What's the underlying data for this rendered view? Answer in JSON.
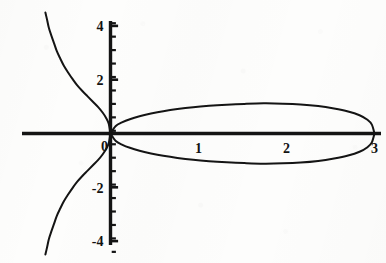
{
  "figure": {
    "background_color": "#fdfdfc",
    "ink_color": "#141414",
    "width": 386,
    "height": 263
  },
  "chart_data": {
    "type": "line",
    "title": "",
    "subtitle": "",
    "xlabel": "",
    "ylabel": "",
    "grid": false,
    "legend": "none",
    "axes": {
      "x_axis_label": "",
      "y_axis_label": "",
      "xlim": [
        -1.15,
        3.55
      ],
      "ylim": [
        -4.6,
        4.6
      ],
      "x_tick_labels": [
        "0",
        "1",
        "2",
        "3"
      ],
      "x_tick_values": [
        0,
        1,
        2,
        3
      ],
      "y_tick_labels": [
        "4",
        "2",
        "-2",
        "-4"
      ],
      "y_tick_values": [
        4,
        2,
        -2,
        -4
      ],
      "y_minor_tick_spacing": 0.5,
      "x_minor_ticks": false,
      "origin_label": "0",
      "axis_line_width_px": 3.2,
      "tick_style": "y-axis only, minor ticks every 0.5"
    },
    "curve_equation": "y^2 = x (x - 3)^2",
    "features": [
      {
        "name": "node",
        "x": 3,
        "y": 0
      },
      {
        "name": "origin-crossing",
        "x": 0,
        "y": 0
      },
      {
        "name": "loop-top-max",
        "x": 1.8,
        "y": 1.12
      },
      {
        "name": "loop-bottom-min",
        "x": 1.8,
        "y": -1.12
      }
    ],
    "series": [
      {
        "name": "loop-upper",
        "points": [
          [
            0,
            0
          ],
          [
            0.06,
            0.28
          ],
          [
            0.13,
            0.41
          ],
          [
            0.22,
            0.53
          ],
          [
            0.33,
            0.64
          ],
          [
            0.46,
            0.74
          ],
          [
            0.6,
            0.83
          ],
          [
            0.76,
            0.91
          ],
          [
            0.94,
            0.98
          ],
          [
            1.12,
            1.03
          ],
          [
            1.32,
            1.07
          ],
          [
            1.52,
            1.1
          ],
          [
            1.74,
            1.12
          ],
          [
            1.96,
            1.11
          ],
          [
            2.16,
            1.08
          ],
          [
            2.36,
            1.02
          ],
          [
            2.54,
            0.93
          ],
          [
            2.7,
            0.82
          ],
          [
            2.83,
            0.68
          ],
          [
            2.92,
            0.51
          ],
          [
            2.97,
            0.33
          ],
          [
            3.0,
            0.0
          ]
        ]
      },
      {
        "name": "loop-lower",
        "points": [
          [
            0,
            0
          ],
          [
            0.06,
            -0.28
          ],
          [
            0.13,
            -0.41
          ],
          [
            0.22,
            -0.53
          ],
          [
            0.33,
            -0.64
          ],
          [
            0.46,
            -0.74
          ],
          [
            0.6,
            -0.83
          ],
          [
            0.76,
            -0.91
          ],
          [
            0.94,
            -0.98
          ],
          [
            1.12,
            -1.03
          ],
          [
            1.32,
            -1.07
          ],
          [
            1.52,
            -1.1
          ],
          [
            1.74,
            -1.12
          ],
          [
            1.96,
            -1.11
          ],
          [
            2.16,
            -1.08
          ],
          [
            2.36,
            -1.02
          ],
          [
            2.54,
            -0.93
          ],
          [
            2.7,
            -0.82
          ],
          [
            2.83,
            -0.68
          ],
          [
            2.92,
            -0.51
          ],
          [
            2.97,
            -0.33
          ],
          [
            3.0,
            0.0
          ]
        ]
      },
      {
        "name": "branch-upper-left",
        "points": [
          [
            0,
            0
          ],
          [
            -0.02,
            0.36
          ],
          [
            -0.05,
            0.58
          ],
          [
            -0.09,
            0.78
          ],
          [
            -0.14,
            0.98
          ],
          [
            -0.2,
            1.18
          ],
          [
            -0.26,
            1.38
          ],
          [
            -0.32,
            1.58
          ],
          [
            -0.38,
            1.8
          ],
          [
            -0.43,
            2.02
          ],
          [
            -0.48,
            2.26
          ],
          [
            -0.53,
            2.52
          ],
          [
            -0.57,
            2.78
          ],
          [
            -0.61,
            3.06
          ],
          [
            -0.64,
            3.34
          ],
          [
            -0.67,
            3.62
          ],
          [
            -0.7,
            3.92
          ],
          [
            -0.72,
            4.22
          ],
          [
            -0.74,
            4.5
          ]
        ]
      },
      {
        "name": "branch-lower-left",
        "points": [
          [
            0,
            0
          ],
          [
            -0.02,
            -0.36
          ],
          [
            -0.05,
            -0.58
          ],
          [
            -0.09,
            -0.78
          ],
          [
            -0.14,
            -0.98
          ],
          [
            -0.2,
            -1.18
          ],
          [
            -0.26,
            -1.38
          ],
          [
            -0.32,
            -1.58
          ],
          [
            -0.38,
            -1.8
          ],
          [
            -0.43,
            -2.02
          ],
          [
            -0.48,
            -2.26
          ],
          [
            -0.53,
            -2.52
          ],
          [
            -0.57,
            -2.78
          ],
          [
            -0.61,
            -3.06
          ],
          [
            -0.64,
            -3.34
          ],
          [
            -0.67,
            -3.62
          ],
          [
            -0.7,
            -3.92
          ],
          [
            -0.72,
            -4.22
          ],
          [
            -0.74,
            -4.5
          ]
        ]
      }
    ]
  }
}
